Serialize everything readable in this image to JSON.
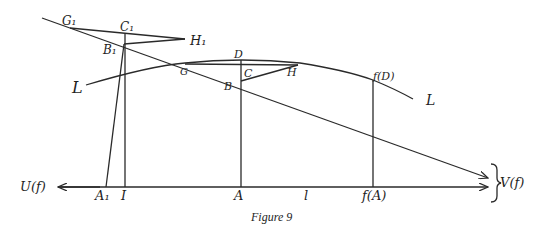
{
  "figure": {
    "caption": "Figure 9",
    "labels": {
      "G1": "G₁",
      "C1": "C₁",
      "H1": "H₁",
      "B1": "B₁",
      "D": "D",
      "G": "G",
      "C": "C",
      "H": "H",
      "B": "B",
      "fD": "f(D)",
      "L_left": "L",
      "L_right": "L",
      "U": "U(f)",
      "V": "V(f)",
      "A1": "A₁",
      "I": "I",
      "A": "A",
      "l": "l",
      "fA": "f(A)"
    }
  },
  "colors": {
    "ink": "#2a2a2a",
    "background": "#ffffff"
  }
}
